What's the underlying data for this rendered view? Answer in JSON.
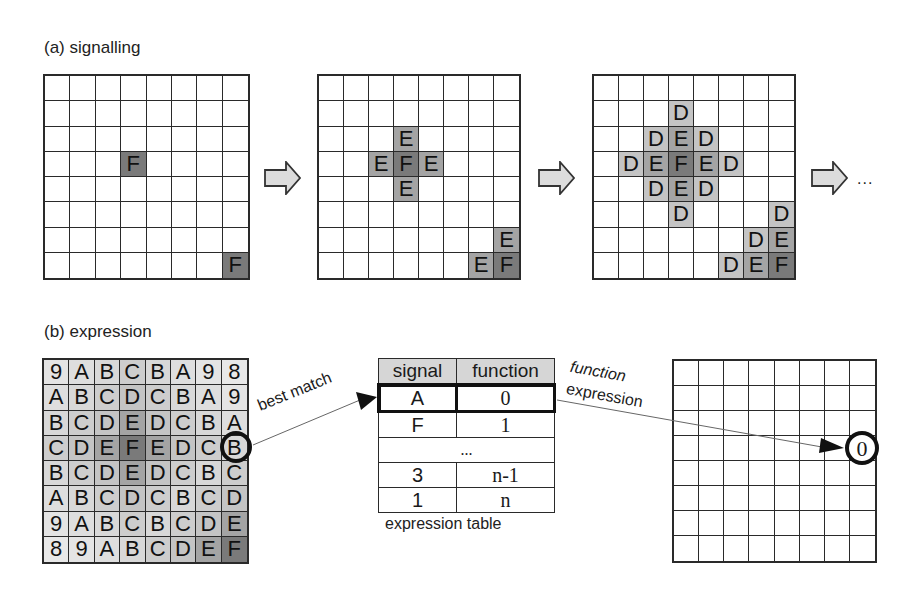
{
  "panel_a": {
    "title": "(a) signalling",
    "grids": [
      {
        "cells": {
          "3,3": "F",
          "7,7": "F"
        }
      },
      {
        "cells": {
          "2,3": "E",
          "3,2": "E",
          "3,3": "F",
          "3,4": "E",
          "4,3": "E",
          "6,7": "E",
          "7,6": "E",
          "7,7": "F"
        }
      },
      {
        "cells": {
          "1,3": "D",
          "2,2": "D",
          "2,3": "E",
          "2,4": "D",
          "3,1": "D",
          "3,2": "E",
          "3,3": "F",
          "3,4": "E",
          "3,5": "D",
          "4,2": "D",
          "4,3": "E",
          "4,4": "D",
          "5,3": "D",
          "5,7": "D",
          "6,6": "D",
          "6,7": "E",
          "7,5": "D",
          "7,6": "E",
          "7,7": "F"
        }
      }
    ],
    "continuation": "..."
  },
  "panel_b": {
    "title": "(b) expression",
    "signal_grid": [
      [
        "9",
        "A",
        "B",
        "C",
        "B",
        "A",
        "9",
        "8"
      ],
      [
        "A",
        "B",
        "C",
        "D",
        "C",
        "B",
        "A",
        "9"
      ],
      [
        "B",
        "C",
        "D",
        "E",
        "D",
        "C",
        "B",
        "A"
      ],
      [
        "C",
        "D",
        "E",
        "F",
        "E",
        "D",
        "C",
        "B"
      ],
      [
        "B",
        "C",
        "D",
        "E",
        "D",
        "C",
        "B",
        "C"
      ],
      [
        "A",
        "B",
        "C",
        "D",
        "C",
        "B",
        "C",
        "D"
      ],
      [
        "9",
        "A",
        "B",
        "C",
        "B",
        "C",
        "D",
        "E"
      ],
      [
        "8",
        "9",
        "A",
        "B",
        "C",
        "D",
        "E",
        "F"
      ]
    ],
    "highlighted_cell": {
      "row": 3,
      "col": 7,
      "value": "B"
    },
    "best_match_label": "best match",
    "table": {
      "headers": [
        "signal",
        "function"
      ],
      "rows": [
        {
          "signal": "A",
          "function": "0",
          "highlighted": true
        },
        {
          "signal": "F",
          "function": "1"
        },
        {
          "ellipsis": "..."
        },
        {
          "signal": "3",
          "function": "n-1"
        },
        {
          "signal": "1",
          "function": "n"
        }
      ],
      "caption": "expression table"
    },
    "function_expression_label": [
      "function",
      "expression"
    ],
    "output_cell": {
      "row": 3,
      "col": 7,
      "value": "0"
    }
  },
  "colors": {
    "F": "#7a7a7a",
    "E": "#a4a4a4",
    "D": "#c4c4c4",
    "C": "#cdcdcd",
    "B": "#d8d8d8",
    "A": "#dedede",
    "9": "#e4e4e4",
    "8": "#e8e8e8",
    "grid_line": "#2a2a2a",
    "arrow_fill": "#dcdcdc"
  }
}
